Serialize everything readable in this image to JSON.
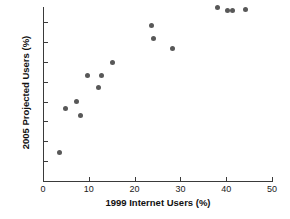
{
  "chart_data": {
    "type": "scatter",
    "title": "",
    "xlabel": "1999 Internet Users (%)",
    "ylabel": "2005 Projected Users (%)",
    "xlim": [
      0,
      50
    ],
    "ylim": [
      0,
      80
    ],
    "xticks": [
      0,
      10,
      20,
      30,
      40,
      50
    ],
    "yticks": [
      0,
      10,
      20,
      30,
      40,
      50,
      60,
      70,
      80
    ],
    "grid": false,
    "legend": null,
    "marker_color": "#585858",
    "axis_color": "#3a3a3a",
    "background": "#ffffff",
    "points": [
      {
        "x": 3.7,
        "y": 14.2
      },
      {
        "x": 5.0,
        "y": 36.5
      },
      {
        "x": 7.4,
        "y": 40.0
      },
      {
        "x": 8.1,
        "y": 32.8
      },
      {
        "x": 9.8,
        "y": 53.0
      },
      {
        "x": 12.2,
        "y": 46.8
      },
      {
        "x": 12.7,
        "y": 53.3
      },
      {
        "x": 15.1,
        "y": 59.5
      },
      {
        "x": 23.6,
        "y": 78.3
      },
      {
        "x": 24.2,
        "y": 71.8
      },
      {
        "x": 28.2,
        "y": 66.8
      },
      {
        "x": 38.0,
        "y": 87.5
      },
      {
        "x": 40.2,
        "y": 86.0
      },
      {
        "x": 41.3,
        "y": 86.0
      },
      {
        "x": 44.3,
        "y": 86.5
      }
    ]
  },
  "axes": {
    "x": {
      "label": "1999 Internet Users (%)",
      "tick_labels": [
        "0",
        "10",
        "20",
        "30",
        "40",
        "50"
      ]
    },
    "y": {
      "label": "2005 Projected Users (%)",
      "tick_labels": [
        "0",
        "10",
        "20",
        "30",
        "40",
        "50",
        "60",
        "70",
        "80"
      ]
    }
  }
}
